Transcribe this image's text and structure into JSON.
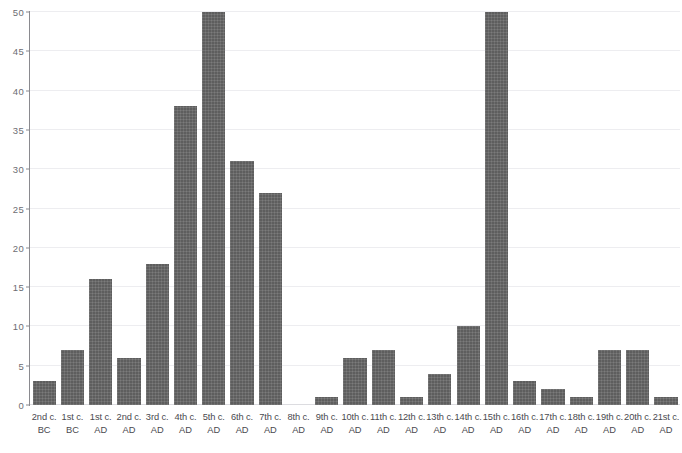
{
  "chart_data": {
    "type": "bar",
    "title": "",
    "subtitle": "",
    "xlabel": "",
    "ylabel": "",
    "ylim": [
      0,
      50
    ],
    "ytick_labels": [
      "0",
      "5",
      "10",
      "15",
      "20",
      "25",
      "30",
      "35",
      "40",
      "45",
      "50"
    ],
    "yticks": [
      0,
      5,
      10,
      15,
      20,
      25,
      30,
      35,
      40,
      45,
      50
    ],
    "grid": true,
    "legend": null,
    "legend_position": "none",
    "bar_color": "#5e5e5e",
    "grid_color": "#ededf0",
    "axis_color": "#8a8a8f",
    "categories": [
      "2nd c. BC",
      "1st c. BC",
      "1st c. AD",
      "2nd c. AD",
      "3rd c. AD",
      "4th c. AD",
      "5th c. AD",
      "6th c. AD",
      "7th c. AD",
      "8th c. AD",
      "9th c. AD",
      "10th c. AD",
      "11th c. AD",
      "12th c. AD",
      "13th c. AD",
      "14th c. AD",
      "15th c. AD",
      "16th c. AD",
      "17th c. AD",
      "18th c. AD",
      "19th c. AD",
      "20th c. AD",
      "21st c. AD"
    ],
    "category_lines": [
      [
        "2nd c.",
        "BC"
      ],
      [
        "1st c.",
        "BC"
      ],
      [
        "1st c.",
        "AD"
      ],
      [
        "2nd c.",
        "AD"
      ],
      [
        "3rd c.",
        "AD"
      ],
      [
        "4th c.",
        "AD"
      ],
      [
        "5th c.",
        "AD"
      ],
      [
        "6th c.",
        "AD"
      ],
      [
        "7th c.",
        "AD"
      ],
      [
        "8th c.",
        "AD"
      ],
      [
        "9th c.",
        "AD"
      ],
      [
        "10th c.",
        "AD"
      ],
      [
        "11th c.",
        "AD"
      ],
      [
        "12th c.",
        "AD"
      ],
      [
        "13th c.",
        "AD"
      ],
      [
        "14th c.",
        "AD"
      ],
      [
        "15th c.",
        "AD"
      ],
      [
        "16th c.",
        "AD"
      ],
      [
        "17th c.",
        "AD"
      ],
      [
        "18th c.",
        "AD"
      ],
      [
        "19th c.",
        "AD"
      ],
      [
        "20th c.",
        "AD"
      ],
      [
        "21st c.",
        "AD"
      ]
    ],
    "values": [
      3,
      7,
      16,
      6,
      18,
      38,
      50,
      31,
      27,
      0,
      1,
      6,
      7,
      1,
      4,
      10,
      50,
      3,
      2,
      1,
      7,
      7,
      1
    ]
  }
}
